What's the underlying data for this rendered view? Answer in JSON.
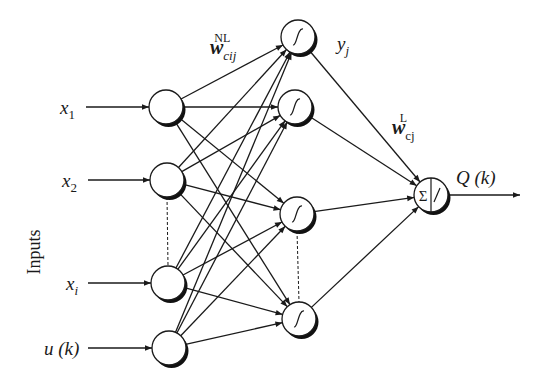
{
  "diagram": {
    "type": "neural-network",
    "axis_label": "Inputs",
    "inputs": [
      {
        "id": "x1",
        "label": "x",
        "sub": "1",
        "cx": 166,
        "cy": 107
      },
      {
        "id": "x2",
        "label": "x",
        "sub": "2",
        "cx": 167,
        "cy": 180
      },
      {
        "id": "xi",
        "label": "x",
        "sub": "i",
        "cx": 168,
        "cy": 283
      },
      {
        "id": "uk",
        "label": "u (k)",
        "sub": "",
        "cx": 169,
        "cy": 348
      }
    ],
    "hidden": [
      {
        "id": "h1",
        "symbol": "∫",
        "cx": 298,
        "cy": 37
      },
      {
        "id": "h2",
        "symbol": "∫",
        "cx": 295,
        "cy": 107
      },
      {
        "id": "h3",
        "symbol": "∫",
        "cx": 297,
        "cy": 214
      },
      {
        "id": "h4",
        "symbol": "∫",
        "cx": 299,
        "cy": 319
      }
    ],
    "output": {
      "id": "out",
      "symbol_left": "Σ",
      "symbol_right": "/",
      "cx": 431,
      "cy": 195,
      "label": "Q (k)"
    },
    "weight_labels": {
      "nonlinear": {
        "base": "w",
        "sub": "cij",
        "sup": "NL"
      },
      "linear": {
        "base": "w",
        "sub": "cj",
        "sup": "L"
      }
    },
    "hidden_output_label": {
      "base": "y",
      "sub": "j"
    },
    "node_radius": 17,
    "colors": {
      "stroke": "#1a1a1a",
      "shadow": "#111111",
      "background": "#ffffff"
    }
  }
}
